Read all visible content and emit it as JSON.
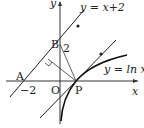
{
  "diagram": {
    "axes": {
      "x_label": "x",
      "y_label": "y",
      "origin_label": "O"
    },
    "points": {
      "A": {
        "label": "A",
        "value_label": "−2"
      },
      "B": {
        "label": "B",
        "value_label": "2"
      },
      "P": {
        "label": "P"
      }
    },
    "curves": {
      "line": {
        "label": "y = x+2"
      },
      "log": {
        "label": "y = ln x"
      }
    },
    "colors": {
      "stroke": "#222222",
      "background": "#ffffff"
    }
  }
}
